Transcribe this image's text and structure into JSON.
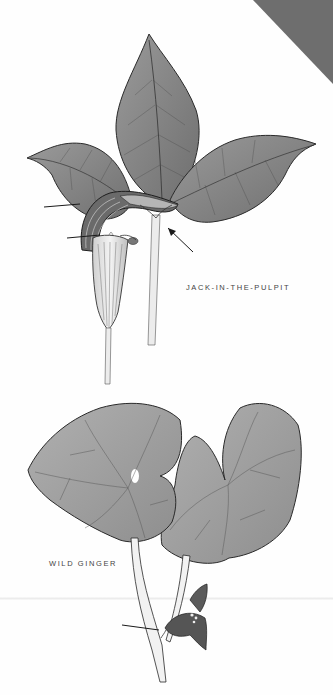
{
  "page": {
    "background": "#fefefe",
    "corner_tab_color": "#6e6e6e"
  },
  "plates": [
    {
      "name": "jack-in-the-pulpit",
      "label": "JACK-IN-THE-PULPIT",
      "pointer_arrows": 3
    },
    {
      "name": "wild-ginger",
      "label": "WILD GINGER",
      "pointer_arrows": 1
    }
  ],
  "colors": {
    "leaf_fill": "#8a8a8a",
    "leaf_light": "#a8a8a8",
    "outline": "#2a2a2a",
    "stem": "#e8e8e8",
    "label_text": "#444444"
  }
}
